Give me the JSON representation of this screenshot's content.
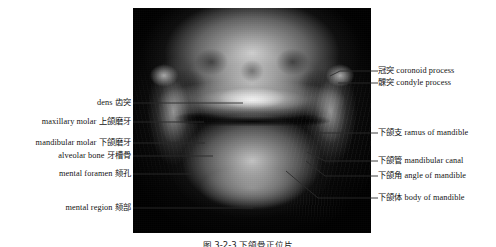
{
  "figure": {
    "type": "annotated-radiograph",
    "modality": "panoramic dental radiograph",
    "caption": "图 3-2-3  下颌骨正位片",
    "image_region": {
      "x": 133,
      "y": 8,
      "width": 238,
      "height": 225
    },
    "background_color": "#ffffff",
    "film_color": "#0a0a0a",
    "text_color": "#131313",
    "leader_color": "#2b2b2b"
  },
  "labels_left": [
    {
      "id": "dens",
      "en": "dens",
      "cn": "齿突",
      "text": "dens 齿突",
      "label_x": 133,
      "label_y": 103,
      "leader": {
        "x1": 133,
        "y1": 103,
        "x2": 243,
        "y2": 103
      }
    },
    {
      "id": "maxillary-molar",
      "en": "maxillary molar",
      "cn": "上颌磨牙",
      "text": "maxillary molar 上颌磨牙",
      "label_x": 133,
      "label_y": 122,
      "leader": {
        "x1": 133,
        "y1": 122,
        "x2": 204,
        "y2": 122
      }
    },
    {
      "id": "mandibular-molar",
      "en": "mandibular molar",
      "cn": "下颌磨牙",
      "text": "mandibular molar 下颌磨牙",
      "label_x": 133,
      "label_y": 143,
      "leader": {
        "x1": 133,
        "y1": 143,
        "x2": 205,
        "y2": 143
      }
    },
    {
      "id": "alveolar-bone",
      "en": "alveolar bone",
      "cn": "牙槽骨",
      "text": "alveolar bone 牙槽骨",
      "label_x": 133,
      "label_y": 156,
      "leader": {
        "x1": 133,
        "y1": 156,
        "x2": 213,
        "y2": 156
      }
    },
    {
      "id": "mental-foramen",
      "en": "mental foramen",
      "cn": "颏孔",
      "text": "mental foramen 颏孔",
      "label_x": 133,
      "label_y": 174,
      "leader": {
        "x1": 133,
        "y1": 174,
        "x2": 192,
        "y2": 174
      }
    },
    {
      "id": "mental-region",
      "en": "mental region",
      "cn": "颏部",
      "text": "mental region 颏部",
      "label_x": 133,
      "label_y": 208,
      "leader": {
        "x1": 133,
        "y1": 208,
        "x2": 253,
        "y2": 208
      }
    }
  ],
  "labels_right": [
    {
      "id": "coronoid-process",
      "en": "coronoid process",
      "cn": "冠突",
      "text": "冠突 coronoid process",
      "label_x": 378,
      "label_y": 71,
      "leader": {
        "x1": 378,
        "y1": 71,
        "x2": 340,
        "y2": 71
      },
      "hook": {
        "x1": 340,
        "y1": 71,
        "x2": 330,
        "y2": 76
      }
    },
    {
      "id": "condyle-process",
      "en": "condyle process",
      "cn": "髁突",
      "text": "髁突 condyle process",
      "label_x": 378,
      "label_y": 83,
      "leader": {
        "x1": 378,
        "y1": 83,
        "x2": 338,
        "y2": 83
      }
    },
    {
      "id": "ramus-of-mandible",
      "en": "ramus of mandible",
      "cn": "下颌支",
      "text": "下颌支 ramus of mandible",
      "label_x": 378,
      "label_y": 133,
      "leader": {
        "x1": 378,
        "y1": 133,
        "x2": 318,
        "y2": 133
      }
    },
    {
      "id": "mandibular-canal",
      "en": "mandibular canal",
      "cn": "下颌管",
      "text": "下颌管 mandibular canal",
      "label_x": 378,
      "label_y": 161,
      "leader": {
        "x1": 378,
        "y1": 161,
        "x2": 325,
        "y2": 161
      },
      "hook": {
        "x1": 325,
        "y1": 161,
        "x2": 307,
        "y2": 152
      }
    },
    {
      "id": "angle-of-mandible",
      "en": "angle of mandible",
      "cn": "下颌角",
      "text": "下颌角 angle of mandible",
      "label_x": 378,
      "label_y": 176,
      "leader": {
        "x1": 378,
        "y1": 176,
        "x2": 325,
        "y2": 176
      },
      "hook": {
        "x1": 325,
        "y1": 176,
        "x2": 306,
        "y2": 161
      }
    },
    {
      "id": "body-of-mandible",
      "en": "body of mandible",
      "cn": "下颌体",
      "text": "下颌体 body of mandible",
      "label_x": 378,
      "label_y": 198,
      "leader": {
        "x1": 378,
        "y1": 198,
        "x2": 318,
        "y2": 198
      },
      "hook": {
        "x1": 318,
        "y1": 198,
        "x2": 286,
        "y2": 171
      }
    }
  ]
}
